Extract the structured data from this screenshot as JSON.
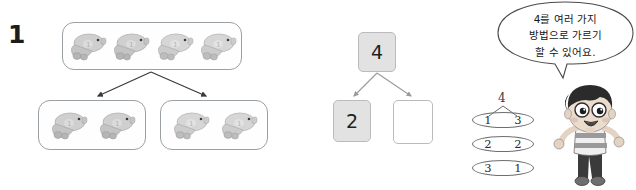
{
  "worksheet": {
    "problem_number": "1",
    "seal_groups": {
      "whole_label": "top-group",
      "whole_count": 4,
      "part_counts": [
        2,
        2
      ]
    },
    "number_bond": {
      "whole": "4",
      "part_left": "2",
      "part_right": "",
      "part_right_placeholder": ""
    },
    "decomposition_chart": {
      "whole": "4",
      "rows": [
        {
          "left": "1",
          "right": "3"
        },
        {
          "left": "2",
          "right": "2"
        },
        {
          "left": "3",
          "right": "1"
        }
      ]
    },
    "speech_bubble": {
      "lines": [
        "4를 여러 가지",
        "방법으로 가르기",
        "할 수 있어요."
      ]
    },
    "character": {
      "name": "cartoon-boy"
    },
    "colors": {
      "box_fill_gray": "#e2e2e2",
      "box_border": "#b9bcbe",
      "outline_gray": "#9aa0a3",
      "ink": "#1c1c1c",
      "seal_body": "#c9c9c9",
      "hair": "#2b2b2b",
      "skin": "#e8d9cc"
    }
  }
}
